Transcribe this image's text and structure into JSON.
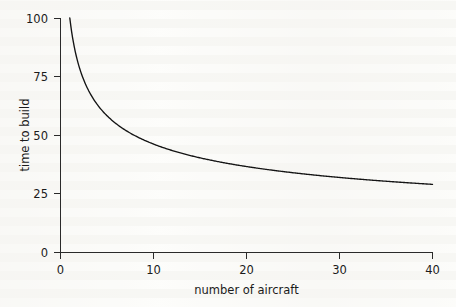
{
  "chart_data": {
    "type": "line",
    "title": "",
    "subtitle": "",
    "xlabel": "number of aircraft",
    "ylabel": "time to build",
    "xlim": [
      0,
      40
    ],
    "ylim": [
      0,
      100
    ],
    "xticks": [
      0,
      10,
      20,
      30,
      40
    ],
    "xtick_labels": [
      "0",
      "10",
      "20",
      "30",
      "40"
    ],
    "yticks": [
      0,
      25,
      50,
      75,
      100
    ],
    "ytick_labels": [
      "0",
      "25",
      "50",
      "75",
      "100"
    ],
    "grid": false,
    "legend": false,
    "legend_position": "none",
    "annotations": [],
    "series": [
      {
        "name": "time to build",
        "description": "learning curve, power law y = 100 * x^(-0.335), plotted from x = 1 to x = 40",
        "color": "#141414",
        "x": [
          1,
          2,
          3,
          4,
          5,
          6,
          7,
          8,
          9,
          10,
          12,
          14,
          16,
          18,
          20,
          22,
          24,
          26,
          28,
          30,
          32,
          34,
          36,
          38,
          40
        ],
        "values": [
          100.0,
          79.3,
          69.4,
          62.9,
          58.3,
          55.0,
          52.3,
          50.0,
          48.2,
          46.6,
          43.9,
          41.7,
          39.7,
          38.2,
          36.9,
          35.7,
          34.7,
          33.8,
          33.0,
          32.3,
          31.6,
          31.0,
          30.4,
          29.9,
          29.4
        ]
      }
    ]
  },
  "axes": {
    "y_title": "time to build",
    "x_title": "number of aircraft",
    "y_labels": [
      "100",
      "75",
      "50",
      "25",
      "0"
    ],
    "x_labels": [
      "0",
      "10",
      "20",
      "30",
      "40"
    ]
  },
  "colors": {
    "background": "#fdfdfb",
    "axis": "#2a2a2a",
    "curve": "#141414",
    "text": "#1b1b1b"
  }
}
